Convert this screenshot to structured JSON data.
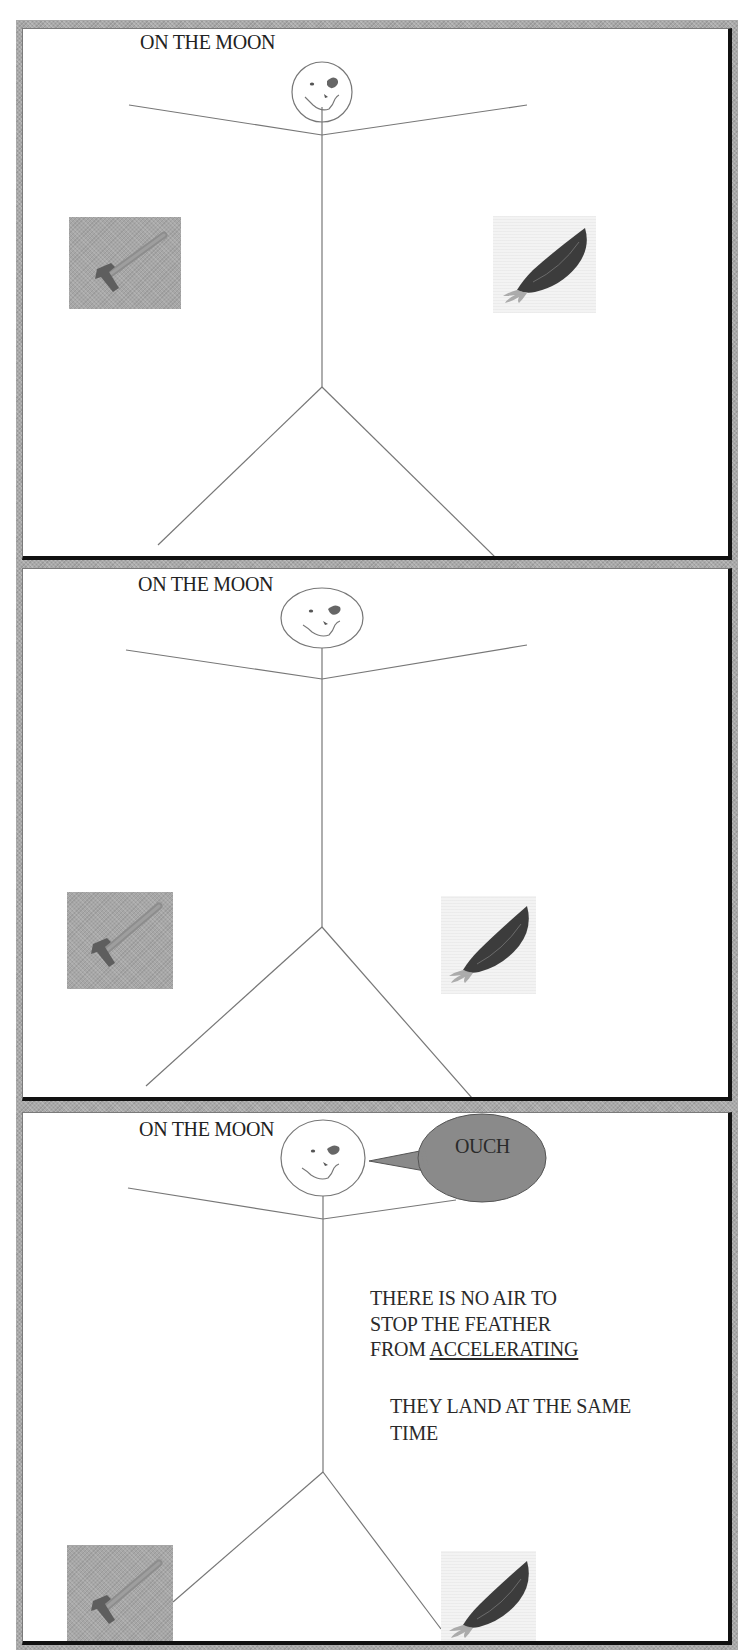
{
  "comic": {
    "colors": {
      "frame_gray": "#a9a9a9",
      "panel_bg": "#ffffff",
      "shadow_edge": "#111111",
      "line": "#777777",
      "bubble_fill": "#8a8a8a",
      "hammer_bg": "#a7a7a7",
      "feather_body": "#3c3c3c"
    },
    "panels": [
      {
        "caption": "ON THE MOON",
        "scene": "Stick figure on the moon holding a hammer and a feather at arm level"
      },
      {
        "caption": "ON THE MOON",
        "scene": "Hammer and feather falling side by side at the same height"
      },
      {
        "caption": "ON THE MOON",
        "scene": "Hammer and feather land together; figure says OUCH",
        "speech_bubble": "OUCH",
        "explanation": {
          "lines": [
            "THERE IS NO AIR TO",
            "STOP THE FEATHER"
          ],
          "last_line_prefix": "FROM ",
          "last_line_underlined": "ACCELERATING"
        },
        "conclusion": {
          "lines": [
            "THEY LAND AT THE SAME",
            "TIME"
          ]
        }
      }
    ]
  }
}
